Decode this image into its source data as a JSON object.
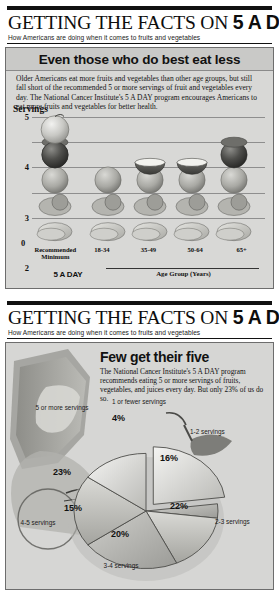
{
  "masthead": {
    "title_light": "GETTING THE FACTS ON ",
    "title_bold": "5 A DAY",
    "subtitle": "How Americans are doing when it comes to fruits and vegetables"
  },
  "panel1": {
    "headline": "Even those who do best eat less",
    "body": "Older Americans eat more fruits and vegetables than other age groups, but still fall short of the recommended 5 or more servings of fruit and vegetables every day. The National Cancer Institute's 5 A DAY program encourages Americans to eat more fruits and vegetables for better health.",
    "y_axis_title": "Servings",
    "x_axis_title": "Age Group (Years)",
    "recommended_label": "Recommended\nMinimum",
    "recommended_brand": "5 A DAY",
    "zero_label": "0"
  },
  "panel2": {
    "headline": "Few get their five",
    "body": "The National Cancer Institute's 5 A DAY program recommends eating 5 or more servings of fruits, vegetables, and juices every day.  But only 23% of us do so."
  },
  "chart_data": [
    {
      "type": "bar",
      "title": "Even those who do best eat less",
      "xlabel": "Age Group (Years)",
      "ylabel": "Servings",
      "ylim": [
        0,
        5
      ],
      "yticks": [
        0,
        1,
        2,
        3,
        4,
        5
      ],
      "grid": true,
      "categories": [
        "Recommended Minimum 5 A DAY",
        "18-34",
        "35-49",
        "50-64",
        "65+"
      ],
      "values": [
        5,
        3,
        3.5,
        3.5,
        4
      ],
      "note": "Bars drawn as stacks of fruit and vegetable illustrations"
    },
    {
      "type": "pie",
      "title": "Few get their five",
      "legend": "inside-slices",
      "labels": [
        "5 or more servings",
        "1 or fewer servings",
        "1-2 servings",
        "2-3 servings",
        "3-4 servings",
        "4-5 servings"
      ],
      "values": [
        23,
        4,
        16,
        22,
        20,
        15
      ],
      "value_labels": [
        "23%",
        "4%",
        "16%",
        "22%",
        "20%",
        "15%"
      ],
      "exploded": [
        "5 or more servings"
      ]
    }
  ],
  "pie_labels": {
    "l1_name": "5 or more\nservings",
    "l1_val": "23%",
    "l2_name": "1 or fewer\nservings",
    "l2_val": "4%",
    "l3_name": "1-2\nservings",
    "l3_val": "16%",
    "l4_name": "2-3\nservings",
    "l4_val": "22%",
    "l5_name": "3-4 servings",
    "l5_val": "20%",
    "l6_name": "4-5\nservings",
    "l6_val": "15%"
  }
}
